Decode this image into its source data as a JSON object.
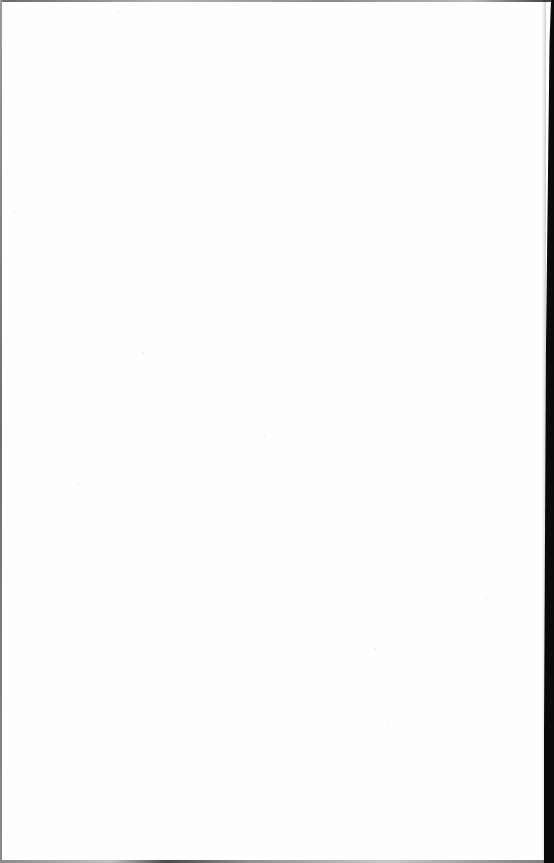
{
  "document": {
    "type": "blank-scanned-page",
    "text": "",
    "colors": {
      "page": "#fefefe",
      "left_edge": "#7a7a7a",
      "right_edge": "#0a0a0a"
    }
  }
}
